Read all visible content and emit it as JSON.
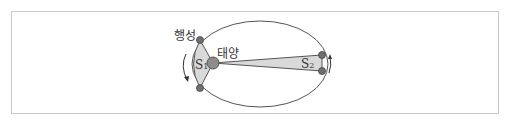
{
  "diagram": {
    "labels": {
      "planet": "행성",
      "sun": "태양",
      "area1_main": "S",
      "area1_sub": "1",
      "area2_main": "S",
      "area2_sub": "2"
    },
    "colors": {
      "frame": "#c8c8c8",
      "orbit": "#555555",
      "area_fill": "#d9d9d9",
      "sun_fill": "#8c8c8c",
      "planet_fill": "#707070"
    }
  }
}
